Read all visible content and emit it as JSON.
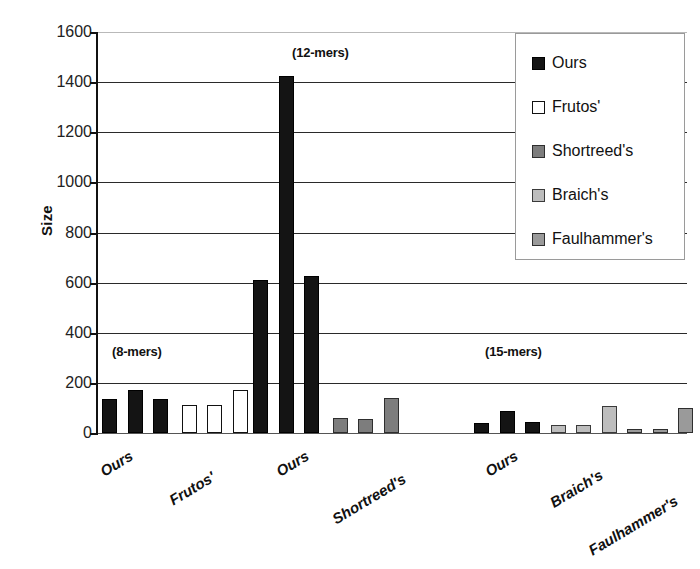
{
  "chart_data": {
    "type": "bar",
    "title": "",
    "xlabel": "",
    "ylabel": "Size",
    "ylim": [
      0,
      1600
    ],
    "ytick_step": 200,
    "yticks": [
      1600,
      1400,
      1200,
      1000,
      800,
      600,
      400,
      200,
      0
    ],
    "grid": "horizontal",
    "legend_position": "top-right",
    "legend": [
      "Ours",
      "Frutos'",
      "Shortreed's",
      "Braich's",
      "Faulhammer's"
    ],
    "series_colors": {
      "Ours": "#141414",
      "Frutos'": "#ffffff",
      "Shortreed's": "#7d7d7d",
      "Braich's": "#bdbdbd",
      "Faulhammer's": "#9a9a9a"
    },
    "group_annotations": [
      "(8-mers)",
      "(12-mers)",
      "(15-mers)"
    ],
    "xtick_labels": [
      "Ours",
      "Frutos'",
      "Ours",
      "Shortreed's",
      "Ours",
      "Braich's",
      "Faulhammer's"
    ],
    "groups": [
      {
        "annotation": "(8-mers)",
        "bars": [
          {
            "series": "Ours",
            "value": 135
          },
          {
            "series": "Ours",
            "value": 172
          },
          {
            "series": "Ours",
            "value": 134
          },
          {
            "series": "Frutos'",
            "value": 110
          },
          {
            "series": "Frutos'",
            "value": 110
          },
          {
            "series": "Frutos'",
            "value": 172
          }
        ]
      },
      {
        "annotation": "(12-mers)",
        "bars": [
          {
            "series": "Ours",
            "value": 612
          },
          {
            "series": "Ours",
            "value": 1425
          },
          {
            "series": "Ours",
            "value": 625
          },
          {
            "series": "Shortreed's",
            "value": 58
          },
          {
            "series": "Shortreed's",
            "value": 55
          },
          {
            "series": "Shortreed's",
            "value": 140
          }
        ]
      },
      {
        "annotation": "(15-mers)",
        "bars": [
          {
            "series": "Ours",
            "value": 40
          },
          {
            "series": "Ours",
            "value": 88
          },
          {
            "series": "Ours",
            "value": 42
          },
          {
            "series": "Braich's",
            "value": 33
          },
          {
            "series": "Braich's",
            "value": 32
          },
          {
            "series": "Braich's",
            "value": 108
          },
          {
            "series": "Faulhammer's",
            "value": 17
          },
          {
            "series": "Faulhammer's",
            "value": 17
          },
          {
            "series": "Faulhammer's",
            "value": 100
          }
        ]
      }
    ]
  },
  "axis": {
    "y_title": "Size"
  }
}
